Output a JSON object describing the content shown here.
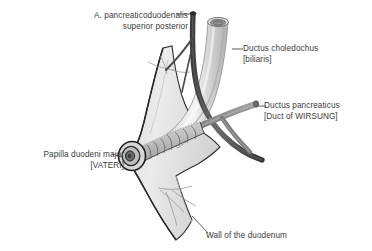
{
  "figure": {
    "background_color": "#ffffff",
    "text_color": "#3b3b3b",
    "width": 372,
    "height": 251
  },
  "palette": {
    "artery_dark": "#4c4c4c",
    "artery_shadow": "#373737",
    "bile_duct_light": "#d8d8d8",
    "bile_duct_mid": "#bfbfbf",
    "bile_duct_highlight": "#efefef",
    "pancreatic_duct": "#8a8a8a",
    "pancreatic_duct_dark": "#6e6e6e",
    "duodenum_wall": "#e3e3e3",
    "duodenum_wall_shade": "#cfcfcf",
    "outline": "#2e2e2e",
    "leader_line": "#4a4a4a"
  },
  "labels": [
    {
      "id": "artery",
      "name": "a-pancreaticoduodenalis-superior-posterior",
      "line1": "A. pancreaticoduodenalis",
      "line2": "superior posterior",
      "align": "right"
    },
    {
      "id": "choledochus",
      "name": "ductus-choledochus",
      "line1": "Ductus choledochus",
      "line2": "[biliaris]",
      "align": "left"
    },
    {
      "id": "pancreaticus",
      "name": "ductus-pancreaticus",
      "line1": "Ductus pancreaticus",
      "line2": "[Duct of WIRSUNG]",
      "align": "left"
    },
    {
      "id": "papilla",
      "name": "papilla-duodeni-major",
      "line1": "Papilla duodeni major",
      "line2": "[VATERI]",
      "align": "right"
    },
    {
      "id": "wall",
      "name": "wall-of-the-duodenum",
      "line1": "Wall of the duodenum",
      "line2": "",
      "align": "left"
    }
  ],
  "structures": [
    {
      "id": "duodenum-wall",
      "name": "duodenum-wall-shape"
    },
    {
      "id": "bile-duct",
      "name": "ductus-choledochus-tube"
    },
    {
      "id": "pancreatic-duct",
      "name": "ductus-pancreaticus-tube"
    },
    {
      "id": "artery",
      "name": "pancreaticoduodenal-artery-tube"
    },
    {
      "id": "ampulla",
      "name": "hepatopancreatic-ampulla"
    },
    {
      "id": "papilla-opening",
      "name": "papilla-duodeni-major-orifice"
    }
  ]
}
